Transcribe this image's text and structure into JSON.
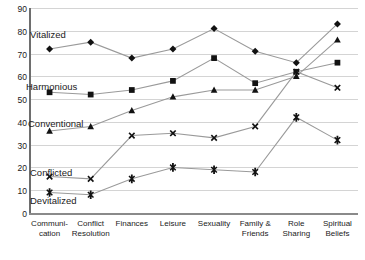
{
  "chart_data": {
    "type": "line",
    "title": "",
    "xlabel": "",
    "ylabel": "",
    "ylim": [
      0,
      90
    ],
    "yticks": [
      0,
      10,
      20,
      30,
      40,
      50,
      60,
      70,
      80,
      90
    ],
    "grid": true,
    "legend": "inline-labels",
    "categories": [
      "Communi-\ncation",
      "Conflict\nResolution",
      "Finances",
      "Leisure",
      "Sexuality",
      "Family &\nFriends",
      "Role\nSharing",
      "Spiritual\nBeliefs"
    ],
    "category_lines": [
      [
        "Communi-",
        "cation"
      ],
      [
        "Conflict",
        "Resolution"
      ],
      [
        "Finances",
        ""
      ],
      [
        "Leisure",
        ""
      ],
      [
        "Sexuality",
        ""
      ],
      [
        "Family &",
        "Friends"
      ],
      [
        "Role",
        "Sharing"
      ],
      [
        "Spiritual",
        "Beliefs"
      ]
    ],
    "series": [
      {
        "name": "Vitalized",
        "marker": "diamond",
        "values": [
          72,
          75,
          68,
          72,
          81,
          71,
          66,
          83
        ]
      },
      {
        "name": "Harmonious",
        "marker": "square",
        "values": [
          53,
          52,
          54,
          58,
          68,
          57,
          62,
          66
        ]
      },
      {
        "name": "Conventional",
        "marker": "triangle",
        "values": [
          36,
          38,
          45,
          51,
          54,
          54,
          60,
          76
        ]
      },
      {
        "name": "Conflicted",
        "marker": "cross",
        "values": [
          16,
          15,
          34,
          35,
          33,
          38,
          62,
          55
        ]
      },
      {
        "name": "Devitalized",
        "marker": "star",
        "values": [
          9,
          8,
          15,
          20,
          19,
          18,
          42,
          32
        ]
      }
    ]
  },
  "axis": {
    "y_labels": [
      "90",
      "80",
      "70",
      "60",
      "50",
      "40",
      "30",
      "20",
      "10",
      "0"
    ]
  },
  "series_labels": [
    {
      "text": "Vitalized",
      "left": 30,
      "top": 30
    },
    {
      "text": "Harmonious",
      "left": 26,
      "top": 82
    },
    {
      "text": "Conventional",
      "left": 28,
      "top": 119
    },
    {
      "text": "Conflicted",
      "left": 30,
      "top": 168
    },
    {
      "text": "Devitalized",
      "left": 30,
      "top": 196
    }
  ],
  "colors": {
    "line": "#9a9a9a",
    "marker": "#121212",
    "grid": "#d4d4d4",
    "axis": "#6e6e6e",
    "text": "#1a1a1a",
    "background": "#ffffff"
  }
}
